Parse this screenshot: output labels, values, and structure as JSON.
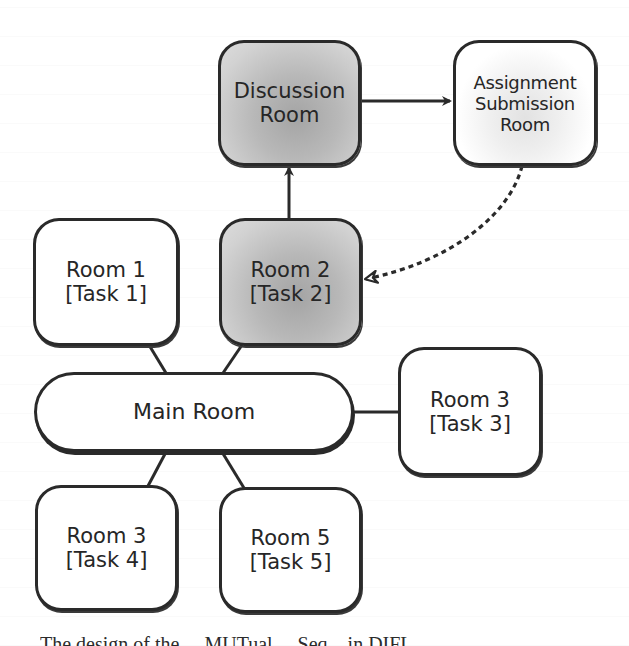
{
  "diagram": {
    "type": "room-navigation-graph",
    "nodes": [
      {
        "id": "discussion",
        "lines": [
          "Discussion",
          "Room"
        ],
        "shaded": true
      },
      {
        "id": "assignment",
        "lines": [
          "Assignment",
          "Submission",
          "Room"
        ],
        "shaded": false
      },
      {
        "id": "room1",
        "lines": [
          "Room 1",
          "[Task 1]"
        ],
        "shaded": false
      },
      {
        "id": "room2",
        "lines": [
          "Room 2",
          "[Task 2]"
        ],
        "shaded": true
      },
      {
        "id": "main",
        "lines": [
          "Main Room"
        ],
        "shaded": false
      },
      {
        "id": "room3_right",
        "lines": [
          "Room 3",
          "[Task 3]"
        ],
        "shaded": false
      },
      {
        "id": "room3_bottom",
        "lines": [
          "Room 3",
          "[Task 4]"
        ],
        "shaded": false
      },
      {
        "id": "room5",
        "lines": [
          "Room 5",
          "[Task 5]"
        ],
        "shaded": false
      }
    ],
    "edges": [
      {
        "from": "room2",
        "to": "discussion",
        "style": "solid",
        "arrow": true
      },
      {
        "from": "discussion",
        "to": "assignment",
        "style": "solid",
        "arrow": true
      },
      {
        "from": "assignment",
        "to": "room2",
        "style": "dashed-curved",
        "arrow": true
      },
      {
        "from": "main",
        "to": "room1",
        "style": "solid",
        "arrow": false
      },
      {
        "from": "main",
        "to": "room2",
        "style": "solid",
        "arrow": false
      },
      {
        "from": "main",
        "to": "room3_right",
        "style": "solid",
        "arrow": false
      },
      {
        "from": "main",
        "to": "room3_bottom",
        "style": "solid",
        "arrow": false
      },
      {
        "from": "main",
        "to": "room5",
        "style": "solid",
        "arrow": false
      }
    ]
  },
  "caption": {
    "text": "The design of the ... MUTual ... Seq... in DIFL",
    "clipped": true
  },
  "colors": {
    "stroke": "#2a2a2a",
    "shaded_fill": "#b8b8b8",
    "plain_fill": "#ffffff"
  }
}
